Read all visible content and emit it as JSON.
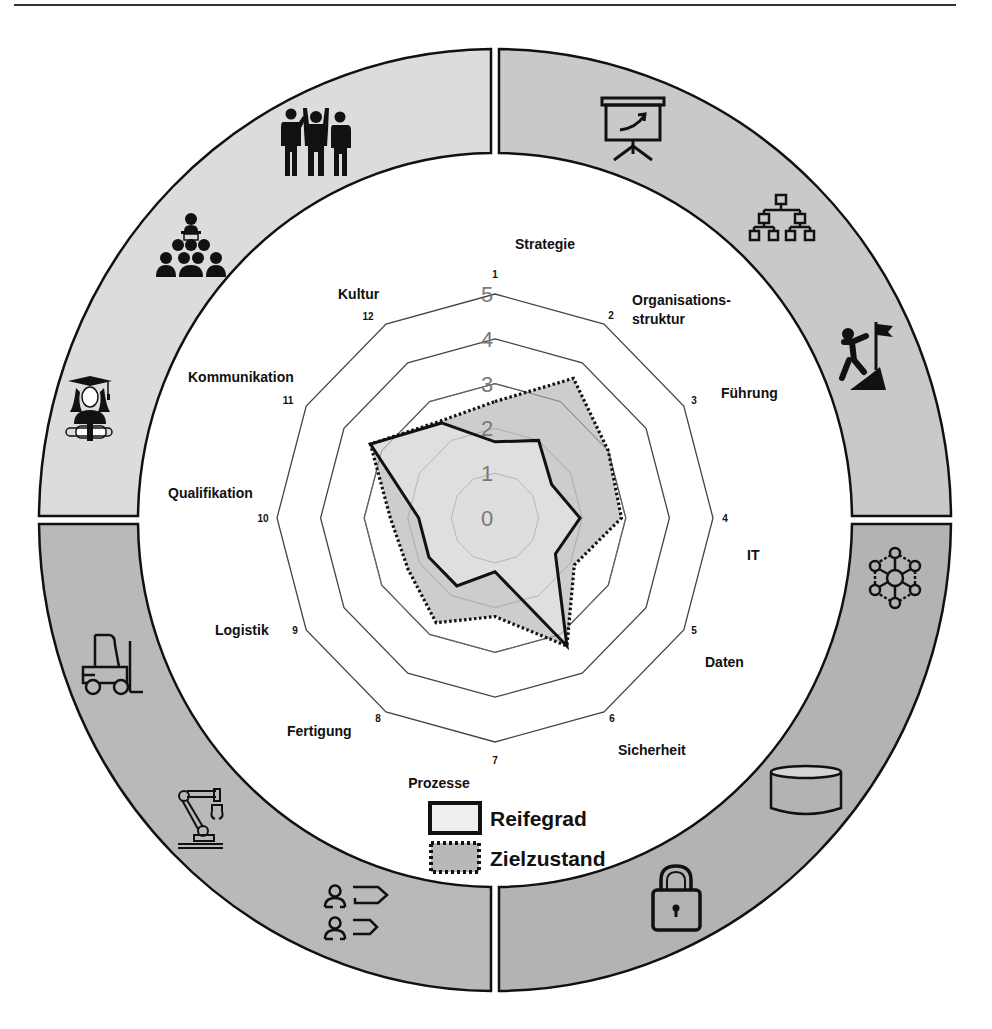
{
  "header": {
    "rule": true
  },
  "chart_data": {
    "type": "radar",
    "title": "",
    "scale": {
      "min": 0,
      "max": 5,
      "ticks": [
        0,
        1,
        2,
        3,
        4,
        5
      ]
    },
    "axes": [
      {
        "num": "1",
        "label": "Strategie"
      },
      {
        "num": "2",
        "label": "Organisations-|struktur"
      },
      {
        "num": "3",
        "label": "Führung"
      },
      {
        "num": "4",
        "label": "IT"
      },
      {
        "num": "5",
        "label": "Daten"
      },
      {
        "num": "6",
        "label": "Sicherheit"
      },
      {
        "num": "7",
        "label": "Prozesse"
      },
      {
        "num": "8",
        "label": "Fertigung"
      },
      {
        "num": "9",
        "label": "Logistik"
      },
      {
        "num": "10",
        "label": "Qualifikation"
      },
      {
        "num": "11",
        "label": "Kommunikation"
      },
      {
        "num": "12",
        "label": "Kultur"
      }
    ],
    "series": [
      {
        "name": "Zielzustand",
        "style": "dotted",
        "fill": "#c4c4c4",
        "values": [
          2.6,
          3.6,
          3.0,
          2.9,
          2.1,
          3.3,
          2.2,
          2.7,
          2.3,
          2.4,
          3.3,
          2.5
        ]
      },
      {
        "name": "Reifegrad",
        "style": "solid",
        "fill": "#e4e4e4",
        "values": [
          1.7,
          2.0,
          1.5,
          1.95,
          1.6,
          3.3,
          1.2,
          1.75,
          1.75,
          1.75,
          3.3,
          2.45
        ]
      }
    ],
    "legend": [
      {
        "label": "Reifegrad",
        "style": "solid"
      },
      {
        "label": "Zielzustand",
        "style": "dotted"
      }
    ],
    "legend_position": "bottom-center"
  },
  "ring": {
    "quadrants": [
      {
        "name": "top-right",
        "color": "#c9c9c9",
        "icons": [
          "presentation-board-icon",
          "org-chart-icon",
          "summit-climber-icon"
        ]
      },
      {
        "name": "bottom-right",
        "color": "#b3b3b3",
        "icons": [
          "network-nodes-icon",
          "database-cylinder-icon",
          "padlock-icon"
        ]
      },
      {
        "name": "bottom-left",
        "color": "#b9b9b9",
        "icons": [
          "process-people-arrows-icon",
          "robot-arm-icon",
          "forklift-icon"
        ]
      },
      {
        "name": "top-left",
        "color": "#dcdcdc",
        "icons": [
          "graduate-diploma-icon",
          "lecture-audience-icon",
          "team-cheering-icon"
        ]
      }
    ]
  },
  "colors": {
    "ring_outline": "#111111",
    "grid_dark": "#444444",
    "grid_light": "#9a9a9a",
    "series_line": "#111111"
  }
}
